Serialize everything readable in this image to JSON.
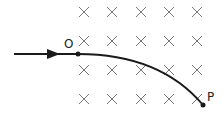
{
  "diagram": {
    "labels": {
      "entry_point": "O",
      "exit_point": "P"
    },
    "field_symbol": "×",
    "field_grid": {
      "columns_x": [
        84,
        112,
        141,
        169,
        197
      ],
      "rows_y": [
        12,
        41,
        70,
        99
      ]
    },
    "colors": {
      "line": "#1a1a1a",
      "cross": "#777777"
    }
  }
}
